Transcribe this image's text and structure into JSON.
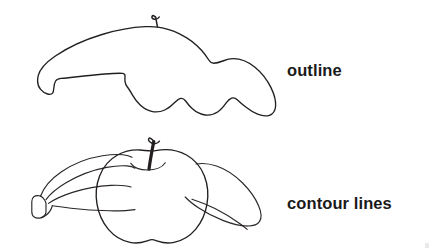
{
  "page": {
    "title": "Outline vs Contour Lines",
    "background_color": "#ffffff",
    "ink_color": "#231f20",
    "text_color": "#1a1a1a"
  },
  "figures": [
    {
      "id": "outline-figure",
      "label": "outline",
      "subject": "banana and apple still life drawn as a single merged silhouette",
      "description": "closed contour with no interior lines",
      "parts": [
        "banana-silhouette",
        "apple-silhouette",
        "apple-stem"
      ]
    },
    {
      "id": "contour-figure",
      "label": "contour lines",
      "subject": "banana and apple still life drawn with interior contour lines",
      "description": "overlapping forms with interior edges visible",
      "parts": [
        "banana-body",
        "banana-ridge-lines",
        "banana-stem-end",
        "apple-body",
        "apple-stem",
        "apple-dimple"
      ]
    }
  ],
  "labels": {
    "outline": "outline",
    "contour_lines": "contour lines"
  }
}
